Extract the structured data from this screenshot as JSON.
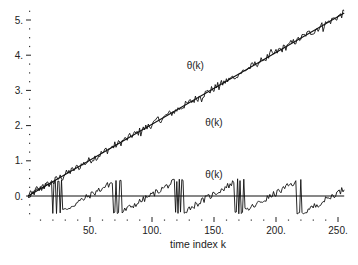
{
  "chart_data": {
    "type": "line",
    "title": "",
    "xlabel": "time index k",
    "ylabel": "",
    "xlim": [
      0,
      255
    ],
    "ylim": [
      -0.6,
      5.3
    ],
    "grid": false,
    "legend": "none",
    "x_ticks": [
      50,
      100,
      150,
      200,
      250
    ],
    "x_tick_labels": [
      "50.",
      "100.",
      "150.",
      "200.",
      "250."
    ],
    "y_ticks": [
      0,
      1,
      2,
      3,
      4,
      5
    ],
    "y_tick_labels": [
      "0.",
      "1.",
      "2.",
      "3.",
      "4.",
      "5."
    ],
    "reference_line": {
      "y": 0.0,
      "description": "horizontal zero line"
    },
    "annotations": [
      {
        "text": "θ(k)",
        "x": 128,
        "y": 3.6,
        "refers_to": "noisy phase estimate (upper noisy line)"
      },
      {
        "text": "θ(k)",
        "x": 143,
        "y": 2.0,
        "refers_to": "true unwrapped phase (straight line)"
      },
      {
        "text": "θ(k)",
        "x": 143,
        "y": 0.5,
        "refers_to": "wrapped phase (bottom sawtooth)"
      }
    ],
    "series": [
      {
        "name": "θ(k) true phase",
        "style": "straight line",
        "x": [
          0,
          255
        ],
        "values": [
          0.0,
          5.2
        ]
      },
      {
        "name": "θ(k) noisy estimate",
        "style": "noisy line following the true phase",
        "x": [
          0,
          25,
          50,
          75,
          100,
          125,
          150,
          175,
          200,
          225,
          255
        ],
        "values": [
          0.05,
          0.55,
          1.0,
          1.55,
          2.05,
          2.55,
          3.05,
          3.55,
          4.05,
          4.55,
          5.15
        ]
      },
      {
        "name": "θ(k) wrapped",
        "style": "sawtooth wrapping between -0.5 and 0.5",
        "x": [
          0,
          22,
          23,
          70,
          71,
          122,
          123,
          172,
          173,
          220,
          221,
          255
        ],
        "values": [
          0.0,
          0.45,
          -0.5,
          0.45,
          -0.5,
          0.45,
          -0.5,
          0.45,
          -0.5,
          0.45,
          -0.5,
          0.2
        ]
      }
    ]
  }
}
